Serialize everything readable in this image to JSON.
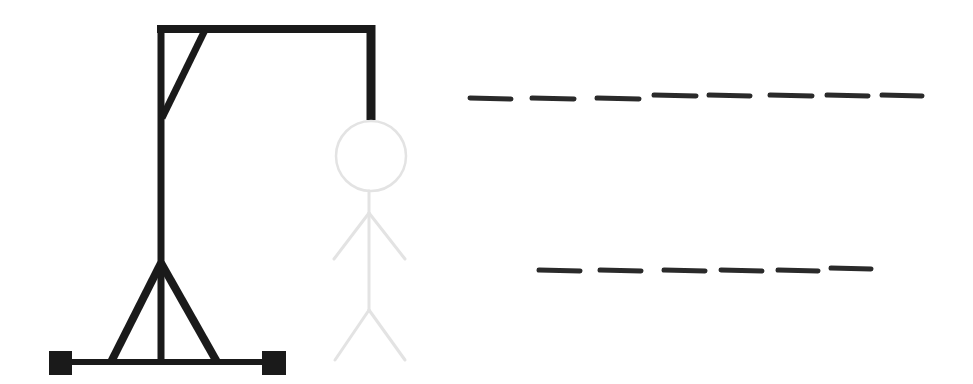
{
  "game": {
    "name": "Hangman",
    "colors": {
      "background": "#ffffff",
      "gallows": "#1a1a1a",
      "figure": "#e3e3e3",
      "blank": "#2a2a2a"
    },
    "gallows": {
      "parts": [
        "base-line",
        "left-foot",
        "right-foot",
        "left-leg-brace",
        "right-leg-brace",
        "upright-post",
        "top-beam",
        "corner-brace",
        "rope"
      ]
    },
    "figure": {
      "state": "faded",
      "parts": [
        "head",
        "body",
        "left-arm",
        "right-arm",
        "left-leg",
        "right-leg"
      ]
    },
    "word": {
      "lines": [
        {
          "letters": [
            "",
            "",
            "",
            "",
            "",
            "",
            "",
            ""
          ],
          "length": 8
        },
        {
          "letters": [
            "",
            "",
            "",
            "",
            "",
            ""
          ],
          "length": 6
        }
      ]
    }
  }
}
